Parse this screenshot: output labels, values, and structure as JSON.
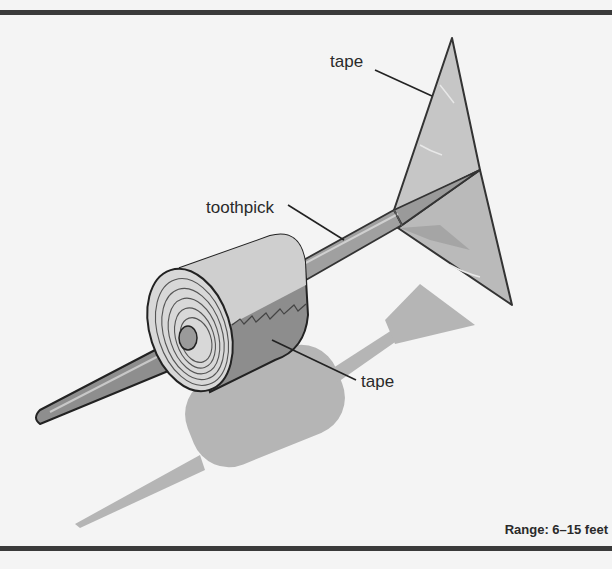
{
  "figure": {
    "labels": {
      "fin_tape": "tape",
      "shaft": "toothpick",
      "roll_tape": "tape"
    },
    "range_text": "Range: 6–15 feet",
    "colors": {
      "background": "#f4f4f4",
      "rule": "#3a3a3a",
      "fin": "#c4c4c4",
      "fin_dark": "#a8a8a8",
      "shaft": "#9a9a9a",
      "roll_top": "#cfcfcf",
      "roll_side": "#8c8c8c",
      "shadow": "#b2b2b2",
      "outline": "#333333"
    }
  }
}
